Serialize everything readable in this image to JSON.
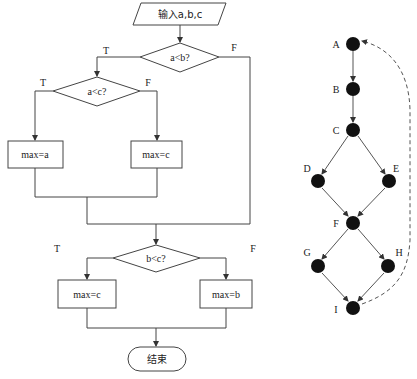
{
  "flowchart": {
    "input_label": "输入a,b,c",
    "decision1": {
      "label": "a<b?",
      "true": "T",
      "false": "F"
    },
    "decision2": {
      "label": "a<c?",
      "true": "T",
      "false": "F"
    },
    "box_max_a": "max=a",
    "box_max_c1": "max=c",
    "decision3": {
      "label": "b<c?",
      "true": "T",
      "false": "F"
    },
    "box_max_c2": "max=c",
    "box_max_b": "max=b",
    "end_label": "结束"
  },
  "graph": {
    "nodes": [
      {
        "id": "A",
        "label": "A"
      },
      {
        "id": "B",
        "label": "B"
      },
      {
        "id": "C",
        "label": "C"
      },
      {
        "id": "D",
        "label": "D"
      },
      {
        "id": "E",
        "label": "E"
      },
      {
        "id": "F",
        "label": "F"
      },
      {
        "id": "G",
        "label": "G"
      },
      {
        "id": "H",
        "label": "H"
      },
      {
        "id": "I",
        "label": "I"
      }
    ],
    "edges": [
      [
        "A",
        "B"
      ],
      [
        "B",
        "C"
      ],
      [
        "C",
        "D"
      ],
      [
        "C",
        "E"
      ],
      [
        "D",
        "F"
      ],
      [
        "E",
        "F"
      ],
      [
        "F",
        "G"
      ],
      [
        "F",
        "H"
      ],
      [
        "G",
        "I"
      ],
      [
        "H",
        "I"
      ]
    ],
    "back_edge": {
      "from": "I",
      "to": "A",
      "style": "dashed"
    }
  }
}
